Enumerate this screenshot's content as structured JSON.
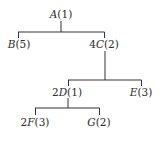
{
  "tree": {
    "nodes": [
      {
        "id": "A",
        "prefix": "",
        "letter": "A",
        "value": "(1)"
      },
      {
        "id": "B",
        "prefix": "",
        "letter": "B",
        "value": "(5)"
      },
      {
        "id": "C",
        "prefix": "4",
        "letter": "C",
        "value": "(2)"
      },
      {
        "id": "D",
        "prefix": "2",
        "letter": "D",
        "value": "(1)"
      },
      {
        "id": "E",
        "prefix": "",
        "letter": "E",
        "value": "(3)"
      },
      {
        "id": "F",
        "prefix": "2",
        "letter": "F",
        "value": "(3)"
      },
      {
        "id": "G",
        "prefix": "",
        "letter": "G",
        "value": "(2)"
      }
    ],
    "edges": [
      [
        "A",
        "B"
      ],
      [
        "A",
        "C"
      ],
      [
        "C",
        "D"
      ],
      [
        "C",
        "E"
      ],
      [
        "D",
        "F"
      ],
      [
        "D",
        "G"
      ]
    ],
    "colors": {
      "line": "#333333",
      "text": "#2a2a2a",
      "background": "#ffffff"
    }
  }
}
